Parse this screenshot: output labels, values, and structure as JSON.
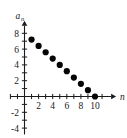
{
  "chart_data": {
    "type": "scatter",
    "title": "",
    "xlabel": "n",
    "ylabel": "a_n",
    "ylabel_base": "a",
    "ylabel_subscript": "n",
    "x": [
      1,
      2,
      3,
      4,
      5,
      6,
      7,
      8,
      9,
      10
    ],
    "values": [
      7.2,
      6.4,
      5.6,
      4.8,
      4.0,
      3.2,
      2.4,
      1.6,
      0.8,
      0.0
    ],
    "series": [
      {
        "name": "a_n",
        "values": [
          7.2,
          6.4,
          5.6,
          4.8,
          4.0,
          3.2,
          2.4,
          1.6,
          0.8,
          0.0
        ]
      }
    ],
    "point_count": 10,
    "marker": "filled-circle",
    "marker_color": "#050505",
    "xlim": [
      -2,
      12
    ],
    "ylim": [
      -4.8,
      9.2
    ],
    "xticks": [
      2,
      4,
      6,
      8,
      10
    ],
    "xtick_labels": [
      "2",
      "4",
      "6",
      "8",
      "10"
    ],
    "yticks": [
      8,
      6,
      4,
      2,
      -2,
      -4
    ],
    "ytick_labels": [
      "8",
      "6",
      "4",
      "2",
      "-2",
      "-4"
    ],
    "xtick_step": 1,
    "ytick_step": 1,
    "grid": false,
    "legend": null,
    "axis_arrows": true
  },
  "axis_labels": {
    "x_name": "n",
    "y_name": "a",
    "y_sub": "n"
  },
  "ticks": {
    "y": [
      {
        "value": 8,
        "label": "8"
      },
      {
        "value": 6,
        "label": "6"
      },
      {
        "value": 4,
        "label": "4"
      },
      {
        "value": 2,
        "label": "2"
      },
      {
        "value": -2,
        "label": "-2"
      },
      {
        "value": -4,
        "label": "-4"
      }
    ],
    "x": [
      {
        "value": 2,
        "label": "2"
      },
      {
        "value": 4,
        "label": "4"
      },
      {
        "value": 6,
        "label": "6"
      },
      {
        "value": 8,
        "label": "8"
      },
      {
        "value": 10,
        "label": "10"
      }
    ]
  }
}
